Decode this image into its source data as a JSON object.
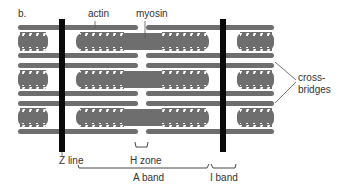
{
  "diagram": {
    "panel_label": "b.",
    "labels": {
      "actin": "actin",
      "myosin": "myosin",
      "cross_bridges_line1": "cross-",
      "cross_bridges_line2": "bridges",
      "z_line": "Z line",
      "h_zone": "H zone",
      "a_band": "A band",
      "i_band": "I band"
    },
    "colors": {
      "filament": "#6e6e6e",
      "filament_edge": "#444444",
      "z_line": "#0a0a0a",
      "cross_bridge": "#ffffff",
      "text": "#333333",
      "background": "#ffffff"
    }
  }
}
